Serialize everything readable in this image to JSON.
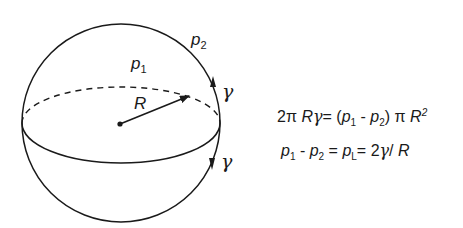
{
  "diagram": {
    "labels": {
      "p1": {
        "base": "p",
        "sub": "1"
      },
      "p2": {
        "base": "p",
        "sub": "2"
      },
      "radius": "R",
      "gamma_top": "γ",
      "gamma_bottom": "γ"
    },
    "equations": {
      "eq1": {
        "lhs_coef": "2π",
        "lhs_R": "R",
        "lhs_gamma": "γ",
        "eq": "=",
        "open": "(",
        "p": "p",
        "sub1": "1",
        "minus": " - ",
        "sub2": "2",
        "close": ")",
        "pi": " π ",
        "R": "R",
        "exp": "2"
      },
      "eq2": {
        "p": "p",
        "sub1": "1",
        "minus": " - ",
        "sub2": "2",
        "eq1": " = ",
        "subL": "L",
        "eq2": "= 2",
        "gamma": "γ",
        "slash": "/ ",
        "R": "R"
      }
    },
    "colors": {
      "stroke": "#1a1a1a",
      "background": "#ffffff"
    }
  }
}
